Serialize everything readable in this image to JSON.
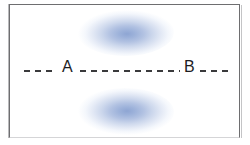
{
  "figure": {
    "title": "",
    "background_color": "#ffffff",
    "frame": {
      "name": "figure-border",
      "color": "#6e6e70"
    },
    "axis": {
      "name": "dashed-axis-line",
      "style": "dashed",
      "color": "#3a3a3c",
      "orientation": "horizontal",
      "labels": [
        {
          "id": "a",
          "text": "A"
        },
        {
          "id": "b",
          "text": "B"
        }
      ],
      "dash_segments": [
        {
          "id": "left",
          "dash_count": 3
        },
        {
          "id": "mid",
          "dash_count": 9
        },
        {
          "id": "right",
          "dash_count": 3
        }
      ]
    },
    "lobes": [
      {
        "id": "upper",
        "label": "upper-lobe",
        "shape": "ellipse",
        "core_color": "#8ea5d3",
        "edge_color": "#ffffff",
        "position": "above-axis"
      },
      {
        "id": "lower",
        "label": "lower-lobe",
        "shape": "ellipse",
        "core_color": "#8ea5d3",
        "edge_color": "#ffffff",
        "position": "below-axis"
      }
    ]
  },
  "chart_data": {
    "type": "scatter",
    "title": "",
    "xlabel": "",
    "ylabel": "",
    "grid": false,
    "legend": null,
    "annotations": [
      "A",
      "B"
    ],
    "series": [
      {
        "name": "upper-lobe",
        "shape": "ellipse",
        "center": [
          125,
          32
        ],
        "width": 80,
        "height": 34,
        "color": "#8ea5d3"
      },
      {
        "name": "lower-lobe",
        "shape": "ellipse",
        "center": [
          125,
          112
        ],
        "width": 80,
        "height": 34,
        "color": "#8ea5d3"
      }
    ],
    "axis_markers": [
      {
        "label": "A",
        "x": 68,
        "y": 71
      },
      {
        "label": "B",
        "x": 188,
        "y": 71
      }
    ]
  }
}
